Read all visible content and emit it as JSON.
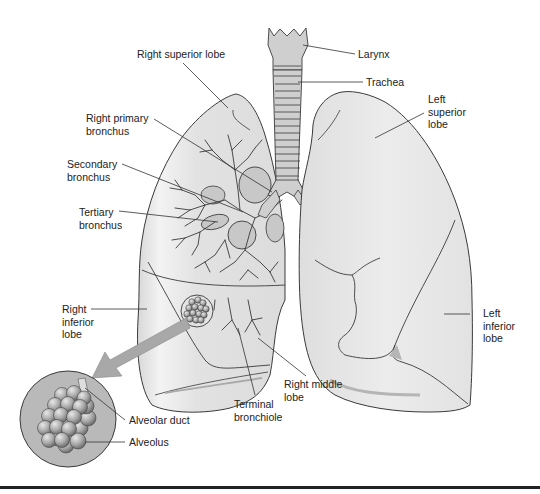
{
  "figure": {
    "colors": {
      "background": "#ffffff",
      "lung_fill": "#e6e6e6",
      "lung_highlight": "#f4f4f4",
      "outline": "#3a3a3a",
      "bronchus_fill": "#c8c8c8",
      "trachea_fill": "#cfcfcf",
      "alveoli_circle_fill": "#b9b9b9",
      "alveolus_fill": "#9a9a9a",
      "arrow_fill": "#a8a8a8",
      "rule": "#222222"
    }
  },
  "labels": {
    "larynx": "Larynx",
    "trachea": "Trachea",
    "right_superior_lobe": "Right superior lobe",
    "right_primary_bronchus": "Right primary\nbronchus",
    "secondary_bronchus": "Secondary\nbronchus",
    "tertiary_bronchus": "Tertiary\nbronchus",
    "left_superior_lobe": "Left\nsuperior\nlobe",
    "right_inferior_lobe": "Right\ninferior\nlobe",
    "left_inferior_lobe": "Left\ninferior\nlobe",
    "right_middle_lobe": "Right middle\nlobe",
    "terminal_bronchiole": "Terminal\nbronchiole",
    "alveolar_duct": "Alveolar duct",
    "alveolus": "Alveolus"
  }
}
